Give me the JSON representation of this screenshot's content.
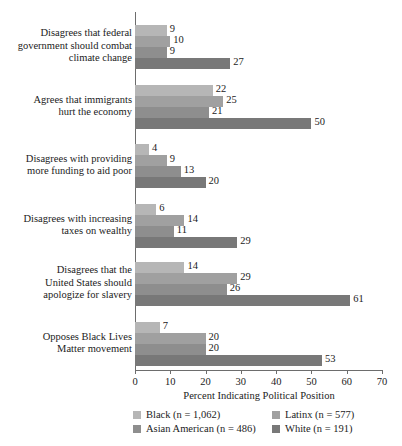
{
  "chart_data": {
    "type": "bar",
    "orientation": "horizontal",
    "title": "",
    "xlabel": "Percent Indicating Political Position",
    "ylabel": "",
    "xlim": [
      0,
      70
    ],
    "xticks": [
      0,
      10,
      20,
      30,
      40,
      50,
      60,
      70
    ],
    "grid": false,
    "legend_position": "bottom",
    "categories": [
      "Disagrees that federal government should combat climate change",
      "Agrees that immigrants hurt the economy",
      "Disagrees with providing more funding to aid poor",
      "Disagrees with increasing taxes on wealthy",
      "Disagrees that the United States should apologize for slavery",
      "Opposes Black Lives Matter movement"
    ],
    "category_lines": [
      [
        "Disagrees that federal",
        "government should combat",
        "climate change"
      ],
      [
        "Agrees that immigrants",
        "hurt the economy"
      ],
      [
        "Disagrees with providing",
        "more funding to aid poor"
      ],
      [
        "Disagrees with increasing",
        "taxes on wealthy"
      ],
      [
        "Disagrees that the",
        "United States should",
        "apologize for slavery"
      ],
      [
        "Opposes Black Lives",
        "Matter movement"
      ]
    ],
    "series": [
      {
        "name": "Black (n = 1,062)",
        "short": "Black",
        "n": "1,062",
        "color": "#b6b6b6",
        "values": [
          9,
          22,
          4,
          6,
          14,
          7
        ]
      },
      {
        "name": "Latinx (n = 577)",
        "short": "Latinx",
        "n": "577",
        "color": "#a0a0a0",
        "values": [
          10,
          25,
          9,
          14,
          29,
          20
        ]
      },
      {
        "name": "Asian American (n = 486)",
        "short": "Asian American",
        "n": "486",
        "color": "#8e8e8e",
        "values": [
          9,
          21,
          13,
          11,
          26,
          20
        ]
      },
      {
        "name": "White (n = 191)",
        "short": "White",
        "n": "191",
        "color": "#787878",
        "values": [
          27,
          50,
          20,
          29,
          61,
          53
        ]
      }
    ],
    "legend_rows": [
      [
        {
          "label": "Black (n = 1,062)",
          "color": "#b6b6b6"
        },
        {
          "label": "Latinx (n = 577)",
          "color": "#a0a0a0"
        }
      ],
      [
        {
          "label": "Asian American (n = 486)",
          "color": "#8e8e8e"
        },
        {
          "label": "White (n = 191)",
          "color": "#787878"
        }
      ]
    ]
  },
  "axis": {
    "x_title": "Percent Indicating Political Position",
    "tick_labels": [
      "0",
      "10",
      "20",
      "30",
      "40",
      "50",
      "60",
      "70"
    ]
  }
}
